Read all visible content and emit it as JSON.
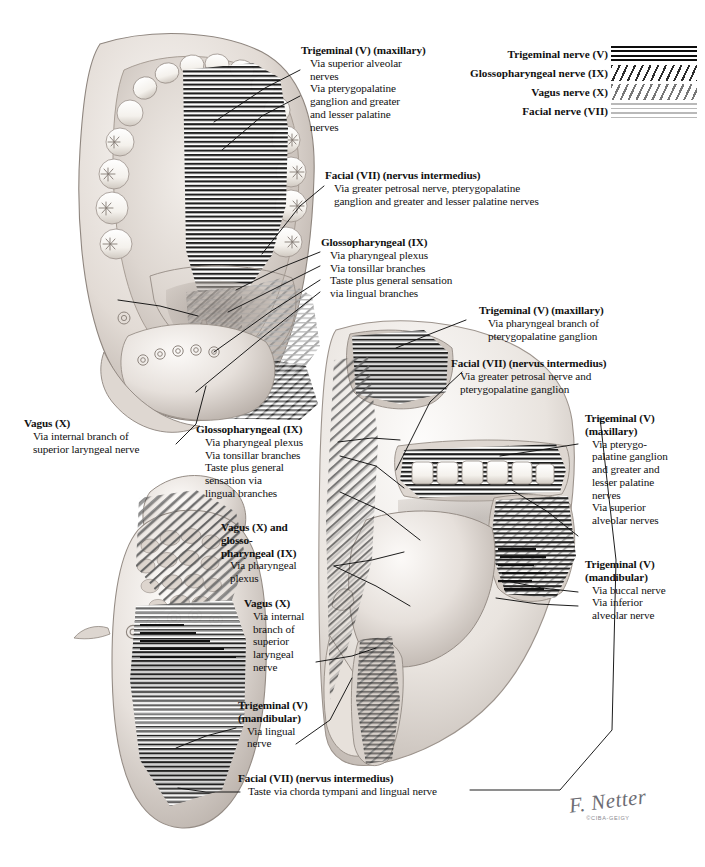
{
  "plate": {
    "title": "Sensory innervation of mouth and pharynx",
    "signature": "F. Netter",
    "copyright": "©CIBA-GEIGY"
  },
  "legend": {
    "items": [
      {
        "label": "Trigeminal nerve (V)",
        "pattern": "thick-black-horizontal-lines",
        "swatch_class": "sw-trig",
        "color": "#0d0d0d"
      },
      {
        "label": "Glossopharyngeal nerve (IX)",
        "pattern": "dark-diagonal-hatching",
        "swatch_class": "sw-glos",
        "color": "#2b2b2b"
      },
      {
        "label": "Vagus nerve (X)",
        "pattern": "light-diagonal-hatching",
        "swatch_class": "sw-vagus",
        "color": "#777777"
      },
      {
        "label": "Facial nerve (VII)",
        "pattern": "thin-light-horizontal-lines",
        "swatch_class": "sw-facial",
        "color": "#b9b9b9"
      }
    ]
  },
  "labels": {
    "trigeminal_maxillary_top": {
      "heading": "Trigeminal (V) (maxillary)",
      "lines": [
        "Via superior alveolar",
        "nerves",
        "Via pterygopalatine",
        "ganglion and greater",
        "and lesser palatine",
        "nerves"
      ]
    },
    "facial_top": {
      "heading": "Facial (VII) (nervus intermedius)",
      "lines": [
        "Via greater petrosal nerve, pterygopalatine",
        "ganglion and greater and lesser palatine nerves"
      ]
    },
    "glossopharyngeal_top": {
      "heading": "Glossopharyngeal (IX)",
      "lines": [
        "Via pharyngeal plexus",
        "Via tonsillar branches",
        "Taste plus general sensation",
        "via lingual branches"
      ]
    },
    "trigeminal_maxillary_mid": {
      "heading": "Trigeminal (V) (maxillary)",
      "lines": [
        "Via pharyngeal branch of",
        "pterygopalatine ganglion"
      ]
    },
    "facial_mid": {
      "heading": "Facial (VII) (nervus intermedius)",
      "lines": [
        "Via greater petrosal nerve and",
        "pterygopalatine ganglion"
      ]
    },
    "trigeminal_maxillary_right": {
      "heading": "Trigeminal (V)",
      "heading2": "(maxillary)",
      "lines": [
        "Via pterygo-",
        "palatine ganglion",
        "and greater and",
        "lesser palatine",
        "nerves",
        "Via superior",
        "alveolar nerves"
      ]
    },
    "trigeminal_mandibular_right": {
      "heading": "Trigeminal (V)",
      "heading2": "(mandibular)",
      "lines": [
        "Via buccal nerve",
        "Via inferior",
        "alveolar nerve"
      ]
    },
    "vagus_left": {
      "heading": "Vagus (X)",
      "lines": [
        "Via internal branch of",
        "superior laryngeal nerve"
      ]
    },
    "glossopharyngeal_left": {
      "heading": "Glossopharyngeal (IX)",
      "lines": [
        "Via pharyngeal plexus",
        "Via tonsillar branches",
        "Taste plus general",
        "sensation via",
        "lingual branches"
      ]
    },
    "vagus_glosso": {
      "heading": "Vagus (X) and",
      "heading2": "glosso-",
      "heading3": "pharyngeal (IX)",
      "lines": [
        "Via pharyngeal",
        "plexus"
      ]
    },
    "vagus_lower": {
      "heading": "Vagus (X)",
      "lines": [
        "Via internal",
        "branch of",
        "superior",
        "laryngeal",
        "nerve"
      ]
    },
    "trigeminal_mandibular_bottom": {
      "heading": "Trigeminal (V)",
      "heading2": "(mandibular)",
      "lines": [
        "Via lingual",
        "nerve"
      ]
    },
    "facial_bottom": {
      "heading": "Facial (VII) (nervus intermedius)",
      "lines": [
        "Taste via chorda tympani and lingual nerve"
      ]
    }
  }
}
